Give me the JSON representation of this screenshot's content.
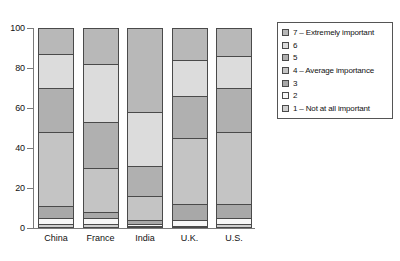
{
  "chart_data": {
    "type": "bar",
    "subtype": "stacked-percentage-column",
    "title": "",
    "xlabel": "",
    "ylabel": "",
    "ylim": [
      0,
      100
    ],
    "yticks": [
      0,
      20,
      40,
      60,
      80,
      100
    ],
    "ytick_labels": [
      "0",
      "20",
      "40",
      "60",
      "80",
      "100"
    ],
    "grid": false,
    "legend_position": "right",
    "categories": [
      "China",
      "France",
      "India",
      "U.K.",
      "U.S."
    ],
    "series": [
      {
        "name": "7 – Extremely important",
        "key": "7",
        "color": "#b8b8b8",
        "values": [
          13,
          18,
          42,
          16,
          14
        ]
      },
      {
        "name": "6",
        "key": "6",
        "color": "#dcdcdc",
        "values": [
          17,
          29,
          27,
          18,
          16
        ]
      },
      {
        "name": "5",
        "key": "5",
        "color": "#b0b0b0",
        "values": [
          22,
          23,
          15,
          21,
          22
        ]
      },
      {
        "name": "4 – Average importance",
        "key": "4",
        "color": "#c4c4c4",
        "values": [
          37,
          22,
          12,
          33,
          36
        ]
      },
      {
        "name": "3",
        "key": "3",
        "color": "#a8a8a8",
        "values": [
          6,
          3,
          2,
          8,
          7
        ]
      },
      {
        "name": "2",
        "key": "2",
        "color": "#f7f7f7",
        "values": [
          3,
          3,
          1,
          3,
          3
        ]
      },
      {
        "name": "1 – Not at all important",
        "key": "1",
        "color": "#cfcfcf",
        "values": [
          2,
          2,
          1,
          1,
          2
        ]
      }
    ]
  },
  "axes": {
    "y_tick_labels": [
      "100",
      "80",
      "60",
      "40",
      "20",
      "0"
    ],
    "x_tick_labels": [
      "China",
      "France",
      "India",
      "U.K.",
      "U.S."
    ]
  },
  "legend": {
    "items": [
      {
        "label": "7 – Extremely important"
      },
      {
        "label": "6"
      },
      {
        "label": "5"
      },
      {
        "label": "4 – Average importance"
      },
      {
        "label": "3"
      },
      {
        "label": "2"
      },
      {
        "label": "1 – Not at all important"
      }
    ]
  },
  "caption": {
    "text": ""
  },
  "colors": {
    "axis": "#7a7a7a",
    "segment_border": "#4a4a4a",
    "legend_border": "#555555",
    "background": "#ffffff"
  }
}
